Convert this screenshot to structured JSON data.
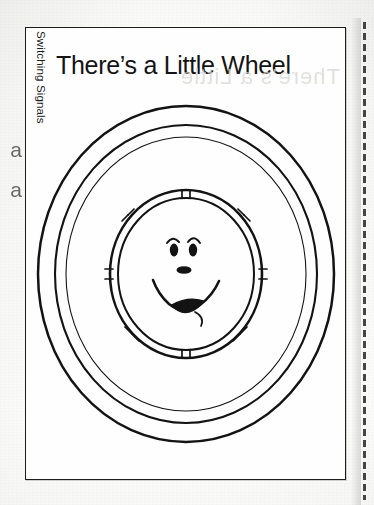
{
  "page": {
    "kind": "scanned-worksheet-page",
    "background_color": "#fbfbfa",
    "ink_color": "#1d1d1d"
  },
  "worksheet": {
    "title": "There’s a Little Wheel",
    "series_label": "Switching Signals",
    "title_bleed_through": "There’s a Little"
  },
  "margin": {
    "bleed_glyphs": "a\na"
  },
  "perforation": {
    "label": "tear-line",
    "color": "#2d2d2d"
  },
  "illustration": {
    "name": "smiling-wheel",
    "description": "Concentric tire rings with a segmented inner rim and a smiling cartoon face at the center",
    "rings": [
      {
        "name": "outer-tire-edge",
        "rx": 148,
        "ry": 168
      },
      {
        "name": "outer-tire-inner-edge",
        "rx": 131,
        "ry": 149
      },
      {
        "name": "sidewall-groove",
        "rx": 120,
        "ry": 137
      },
      {
        "name": "rim-outer",
        "rx": 76,
        "ry": 84
      },
      {
        "name": "rim-inner",
        "rx": 68,
        "ry": 76
      }
    ],
    "rim_segment_count": 8,
    "face": {
      "name": "smiling-face",
      "features": [
        "left-eye",
        "right-eye",
        "left-brow",
        "right-brow",
        "nose",
        "open-smile-mouth",
        "tongue"
      ]
    }
  }
}
